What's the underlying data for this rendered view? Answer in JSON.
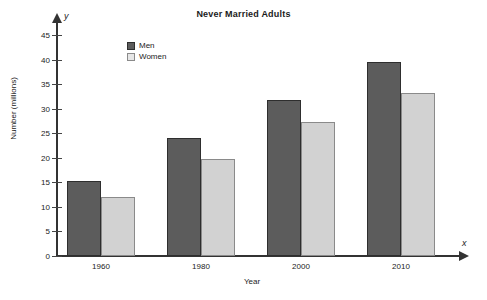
{
  "chart_data": {
    "type": "bar",
    "title": "Never Married Adults",
    "xlabel": "Year",
    "ylabel": "Number (millions)",
    "x_axis_variable": "x",
    "y_axis_variable": "y",
    "categories": [
      "1960",
      "1980",
      "2000",
      "2010"
    ],
    "series": [
      {
        "name": "Men",
        "color": "#5c5c5c",
        "values": [
          15.2,
          24.0,
          31.8,
          39.5
        ]
      },
      {
        "name": "Women",
        "color": "#d2d2d2",
        "values": [
          12.1,
          19.8,
          27.2,
          33.2
        ]
      }
    ],
    "ylim": [
      0,
      45
    ],
    "ytick_values": [
      0,
      5,
      10,
      15,
      20,
      25,
      30,
      35,
      40,
      45
    ],
    "ytick_labels": [
      "0",
      "5",
      "10",
      "15",
      "20",
      "25",
      "30",
      "35",
      "40",
      "45"
    ],
    "grid": false,
    "legend_position": "upper-left-inside"
  },
  "legend": {
    "entries": [
      {
        "label": "Men"
      },
      {
        "label": "Women"
      }
    ]
  }
}
